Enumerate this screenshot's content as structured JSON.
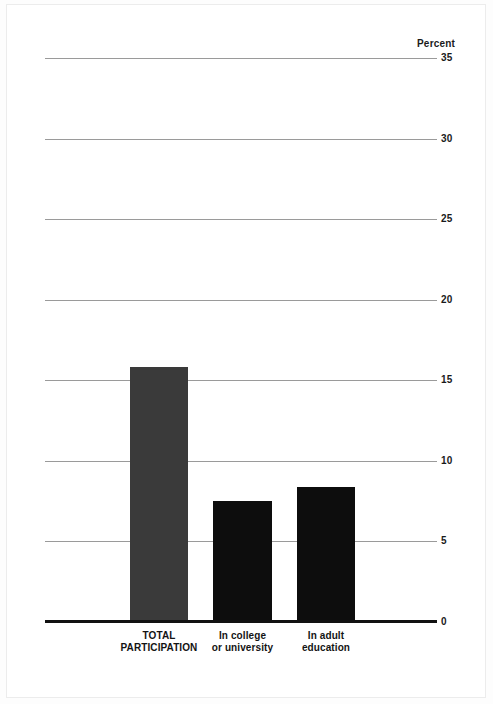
{
  "chart_data": {
    "type": "bar",
    "title": "",
    "subtitle": "",
    "xlabel": "",
    "ylabel": "Percent",
    "ylim": [
      0,
      35
    ],
    "yticks": [
      0,
      5,
      10,
      15,
      20,
      25,
      30,
      35
    ],
    "ytick_labels": [
      "0",
      "5",
      "10",
      "15",
      "20",
      "25",
      "30",
      "35"
    ],
    "grid": true,
    "legend": "none",
    "categories": [
      "TOTAL PARTICIPATION",
      "In college or university",
      "In adult education"
    ],
    "category_lines": [
      [
        "TOTAL",
        "PARTICIPATION"
      ],
      [
        "In college",
        "or university"
      ],
      [
        "In adult",
        "education"
      ]
    ],
    "values": [
      15.8,
      7.5,
      8.4
    ],
    "bar_colors": [
      "#3a3a3a",
      "#0d0d0d",
      "#0d0d0d"
    ]
  },
  "axis": {
    "unit_header": "Percent"
  },
  "colors": {
    "gridline": "#9a9a9a",
    "baseline": "#111111",
    "page_background": "#ffffff",
    "text": "#141414"
  }
}
